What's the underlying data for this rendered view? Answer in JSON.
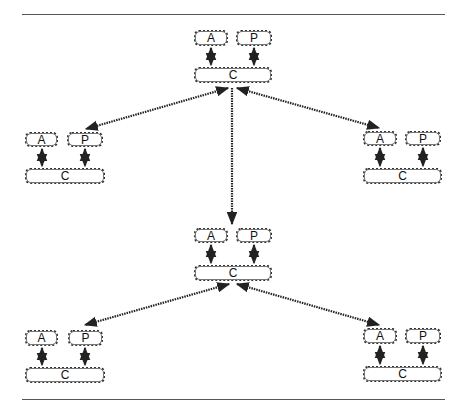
{
  "diagram": {
    "colors": {
      "stroke": "#222222",
      "rule": "#555555",
      "box_border": "#333333",
      "background": "#ffffff"
    },
    "groups": [
      {
        "id": "top",
        "a_label": "A",
        "p_label": "P",
        "c_label": "C"
      },
      {
        "id": "left",
        "a_label": "A",
        "p_label": "P",
        "c_label": "C"
      },
      {
        "id": "right",
        "a_label": "A",
        "p_label": "P",
        "c_label": "C"
      },
      {
        "id": "middle",
        "a_label": "A",
        "p_label": "P",
        "c_label": "C"
      },
      {
        "id": "bottom-left",
        "a_label": "A",
        "p_label": "P",
        "c_label": "C"
      },
      {
        "id": "bottom-right",
        "a_label": "A",
        "p_label": "P",
        "c_label": "C"
      }
    ],
    "edges": [
      {
        "from": "top",
        "to": "left",
        "style": "dotted-double-arrow"
      },
      {
        "from": "top",
        "to": "right",
        "style": "dotted-double-arrow"
      },
      {
        "from": "top",
        "to": "middle",
        "style": "dotted-arrow"
      },
      {
        "from": "middle",
        "to": "bottom-left",
        "style": "dotted-double-arrow"
      },
      {
        "from": "middle",
        "to": "bottom-right",
        "style": "dotted-double-arrow"
      }
    ]
  }
}
